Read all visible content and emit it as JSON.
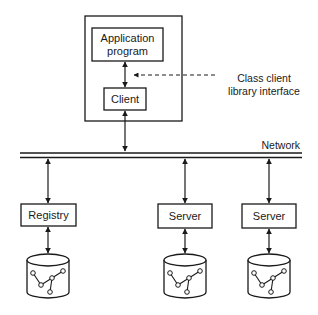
{
  "diagram": {
    "client_host": {
      "application_box": {
        "line1": "Application",
        "line2": "program"
      },
      "client_box": {
        "label": "Client"
      }
    },
    "annotation": {
      "line1": "Class client",
      "line2": "library interface"
    },
    "network": {
      "label": "Network"
    },
    "nodes": [
      {
        "label": "Registry",
        "icon": "database-icon"
      },
      {
        "label": "Server",
        "icon": "database-icon"
      },
      {
        "label": "Server",
        "icon": "database-icon"
      }
    ],
    "colors": {
      "stroke": "#1a1a1a",
      "background": "#ffffff"
    }
  }
}
